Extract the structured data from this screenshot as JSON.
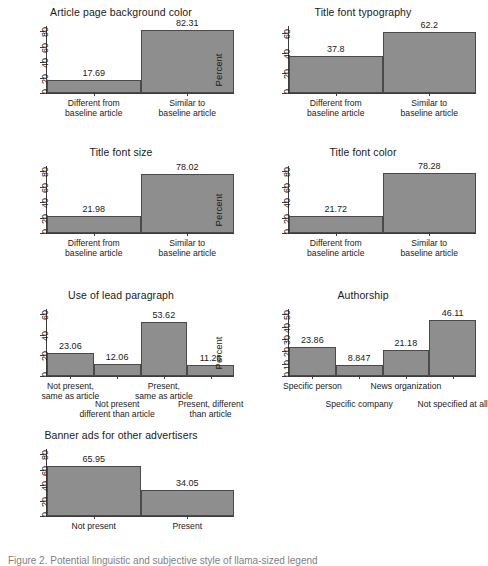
{
  "figure": {
    "caption": "Figure 2. Potential linguistic and subjective style of llama-sized legend",
    "bar_color": "#8e8e8e",
    "bar_border": "#4a4a4a",
    "axis_color": "#3d3d3d",
    "ylabel": "Percent"
  },
  "chart_data": [
    {
      "type": "bar",
      "title": "Article page background color",
      "xlabel": "",
      "ylabel": "Percent",
      "categories": [
        "Different from\nbaseline article",
        "Similar to\nbaseline article"
      ],
      "category_lines": [
        [
          "Different from",
          "baseline article"
        ],
        [
          "Similar to",
          "baseline article"
        ]
      ],
      "values": [
        17.69,
        82.31
      ],
      "value_labels": [
        "17.69",
        "82.31"
      ],
      "yticks": [
        0,
        20,
        40,
        60,
        80
      ],
      "ytick_labels": [
        "0",
        "20",
        "40",
        "60",
        "80"
      ],
      "ylim": [
        0,
        88
      ],
      "grid": false,
      "legend": "none",
      "label_stagger": false
    },
    {
      "type": "bar",
      "title": "Title font typography",
      "xlabel": "",
      "ylabel": "Percent",
      "categories": [
        "Different from\nbaseline article",
        "Similar to\nbaseline article"
      ],
      "category_lines": [
        [
          "Different from",
          "baseline article"
        ],
        [
          "Similar to",
          "baseline article"
        ]
      ],
      "values": [
        37.8,
        62.2
      ],
      "value_labels": [
        "37.8",
        "62.2"
      ],
      "yticks": [
        0,
        20,
        40,
        60
      ],
      "ytick_labels": [
        "0",
        "20",
        "40",
        "60"
      ],
      "ylim": [
        0,
        68
      ],
      "grid": false,
      "legend": "none",
      "label_stagger": false
    },
    {
      "type": "bar",
      "title": "Title font size",
      "xlabel": "",
      "ylabel": "Percent",
      "categories": [
        "Different from\nbaseline article",
        "Similar to\nbaseline article"
      ],
      "category_lines": [
        [
          "Different from",
          "baseline article"
        ],
        [
          "Similar to",
          "baseline article"
        ]
      ],
      "values": [
        21.98,
        78.02
      ],
      "value_labels": [
        "21.98",
        "78.02"
      ],
      "yticks": [
        0,
        20,
        40,
        60,
        80
      ],
      "ytick_labels": [
        "0",
        "20",
        "40",
        "60",
        "80"
      ],
      "ylim": [
        0,
        88
      ],
      "grid": false,
      "legend": "none",
      "label_stagger": false
    },
    {
      "type": "bar",
      "title": "Title font color",
      "xlabel": "",
      "ylabel": "Percent",
      "categories": [
        "Different from\nbaseline article",
        "Similar to\nbaseline article"
      ],
      "category_lines": [
        [
          "Different from",
          "baseline article"
        ],
        [
          "Similar to",
          "baseline article"
        ]
      ],
      "values": [
        21.72,
        78.28
      ],
      "value_labels": [
        "21.72",
        "78.28"
      ],
      "yticks": [
        0,
        20,
        40,
        60,
        80
      ],
      "ytick_labels": [
        "0",
        "20",
        "40",
        "60",
        "80"
      ],
      "ylim": [
        0,
        88
      ],
      "grid": false,
      "legend": "none",
      "label_stagger": false
    },
    {
      "type": "bar",
      "title": "Use of lead paragraph",
      "xlabel": "",
      "ylabel": "Percent",
      "categories": [
        "Not present,\nsame as article",
        "Not present\ndifferent than article",
        "Present,\nsame as article",
        "Present, different\nthan article"
      ],
      "category_lines": [
        [
          "Not present,",
          "same as article"
        ],
        [
          "Not present",
          "different than article"
        ],
        [
          "Present,",
          "same as article"
        ],
        [
          "Present, different",
          "than article"
        ]
      ],
      "values": [
        23.06,
        12.06,
        53.62,
        11.26
      ],
      "value_labels": [
        "23.06",
        "12.06",
        "53.62",
        "11.26"
      ],
      "yticks": [
        0,
        20,
        40,
        60
      ],
      "ytick_labels": [
        "0",
        "20",
        "40",
        "60"
      ],
      "ylim": [
        0,
        66
      ],
      "grid": false,
      "legend": "none",
      "label_stagger": true
    },
    {
      "type": "bar",
      "title": "Authorship",
      "xlabel": "",
      "ylabel": "Percent",
      "categories": [
        "Specific person",
        "Specific company",
        "News organization",
        "Not specified at all"
      ],
      "category_lines": [
        [
          "Specific person"
        ],
        [
          "Specific company"
        ],
        [
          "News organization"
        ],
        [
          "Not specified at all"
        ]
      ],
      "values": [
        23.86,
        8.847,
        21.18,
        46.11
      ],
      "value_labels": [
        "23.86",
        "8.847",
        "21.18",
        "46.11"
      ],
      "yticks": [
        0,
        10,
        20,
        30,
        40,
        50
      ],
      "ytick_labels": [
        "0",
        "10",
        "20",
        "30",
        "40",
        "50"
      ],
      "ylim": [
        0,
        55
      ],
      "grid": false,
      "legend": "none",
      "label_stagger": true
    },
    {
      "type": "bar",
      "title": "Banner ads for other advertisers",
      "xlabel": "",
      "ylabel": "Percent",
      "categories": [
        "Not present",
        "Present"
      ],
      "category_lines": [
        [
          "Not present"
        ],
        [
          "Present"
        ]
      ],
      "values": [
        65.95,
        34.05
      ],
      "value_labels": [
        "65.95",
        "34.05"
      ],
      "yticks": [
        0,
        20,
        40,
        60,
        80
      ],
      "ytick_labels": [
        "0",
        "20",
        "40",
        "60",
        "80"
      ],
      "ylim": [
        0,
        88
      ],
      "grid": false,
      "legend": "none",
      "label_stagger": false
    }
  ]
}
